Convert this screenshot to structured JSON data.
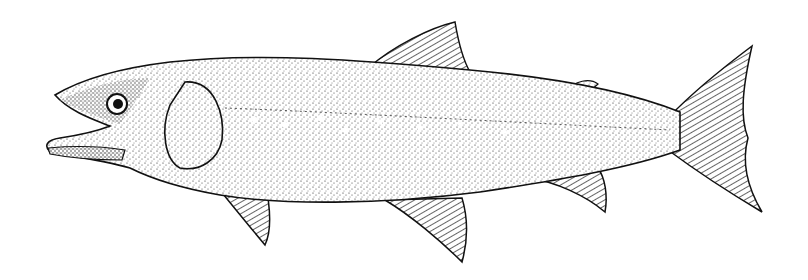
{
  "image": {
    "subject": "fish",
    "style": "stippled black-and-white scientific illustration",
    "background_color": "#ffffff",
    "ink_color": "#111111"
  }
}
